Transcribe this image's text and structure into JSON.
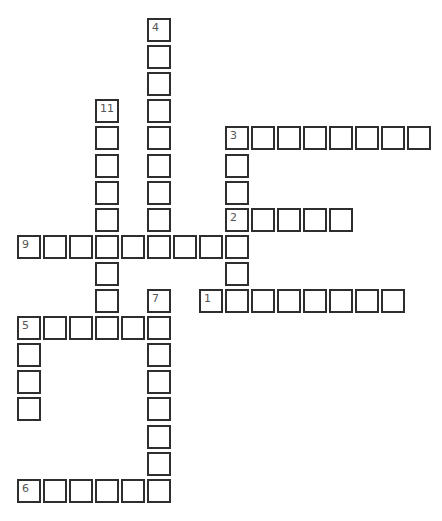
{
  "puzzle": {
    "type": "crossword",
    "layout": {
      "origin_x": 17,
      "origin_y": 18,
      "col_stride": 26,
      "row_stride": 27.1
    },
    "border_color": "#2e2e2e",
    "words": [
      {
        "number": "4",
        "direction": "down",
        "col": 5,
        "row": 0,
        "length": 9
      },
      {
        "number": "11",
        "direction": "down",
        "col": 3,
        "row": 3,
        "length": 8
      },
      {
        "number": "3",
        "direction": "across",
        "col": 8,
        "row": 4,
        "length": 8
      },
      {
        "number": "3",
        "direction": "down",
        "col": 8,
        "row": 4,
        "length": 7
      },
      {
        "number": "2",
        "direction": "across",
        "col": 8,
        "row": 7,
        "length": 5
      },
      {
        "number": "9",
        "direction": "across",
        "col": 0,
        "row": 8,
        "length": 9
      },
      {
        "number": "1",
        "direction": "across",
        "col": 7,
        "row": 10,
        "length": 8
      },
      {
        "number": "7",
        "direction": "down",
        "col": 5,
        "row": 10,
        "length": 8
      },
      {
        "number": "5",
        "direction": "across",
        "col": 0,
        "row": 11,
        "length": 6
      },
      {
        "number": "5",
        "direction": "down",
        "col": 0,
        "row": 11,
        "length": 4
      },
      {
        "number": "6",
        "direction": "across",
        "col": 0,
        "row": 17,
        "length": 6
      }
    ]
  }
}
